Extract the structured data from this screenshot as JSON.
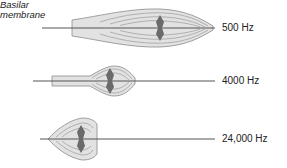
{
  "title_label": {
    "line1": "Basilar",
    "line2": "membrane"
  },
  "rows": [
    {
      "frequency": "500 Hz"
    },
    {
      "frequency": "4000 Hz"
    },
    {
      "frequency": "24,000 Hz"
    }
  ],
  "colors": {
    "fill": "#e2e2e2",
    "contour": "#9a9a9a",
    "outline": "#8a8a8a",
    "axis": "#555555",
    "arrow": "#6a6a6a",
    "text": "#222222"
  }
}
